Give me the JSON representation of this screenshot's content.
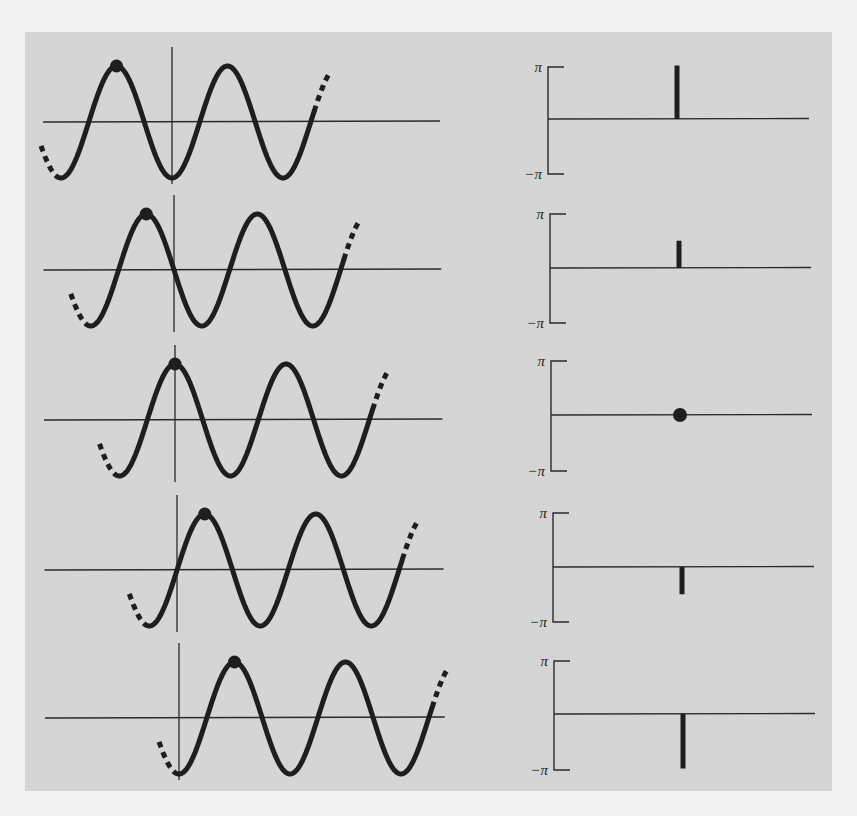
{
  "figure": {
    "background_color": "#f3f3f3",
    "panel_color": "#d5d5d5",
    "curve_color": "#1e1e1e",
    "axis_color": "#2a2a2a"
  },
  "chart_data": {
    "type": "diagram",
    "title": "",
    "phase_axis": {
      "top_label": "π",
      "bottom_label": "−π",
      "range": [
        -3.14159,
        3.14159
      ]
    },
    "rows": [
      {
        "index": 1,
        "wave": {
          "peak_offset_fraction_of_period": -0.5,
          "marker": "peak-dot"
        },
        "phase": {
          "value": 3.14159,
          "label": "π",
          "marker": "stick"
        },
        "layout": {
          "axis_y": 122,
          "vaxis_x": 172,
          "phase_axis_y": 119,
          "pi_top_y": 67,
          "pi_bottom_y": 174,
          "bracket_x": 548,
          "stick_x": 677,
          "axis_end_x": 809
        }
      },
      {
        "index": 2,
        "wave": {
          "peak_offset_fraction_of_period": -0.25,
          "marker": "peak-dot"
        },
        "phase": {
          "value": 1.5708,
          "label": "π/2",
          "marker": "stick"
        },
        "layout": {
          "axis_y": 270,
          "vaxis_x": 174,
          "phase_axis_y": 268,
          "pi_top_y": 214,
          "pi_bottom_y": 323,
          "bracket_x": 550,
          "stick_x": 679,
          "axis_end_x": 811
        }
      },
      {
        "index": 3,
        "wave": {
          "peak_offset_fraction_of_period": 0,
          "marker": "peak-dot"
        },
        "phase": {
          "value": 0,
          "label": "0",
          "marker": "dot"
        },
        "layout": {
          "axis_y": 420,
          "vaxis_x": 175,
          "phase_axis_y": 415,
          "pi_top_y": 361,
          "pi_bottom_y": 471,
          "bracket_x": 551,
          "stick_x": 680,
          "axis_end_x": 812
        }
      },
      {
        "index": 4,
        "wave": {
          "peak_offset_fraction_of_period": 0.25,
          "marker": "peak-dot"
        },
        "phase": {
          "value": -1.5708,
          "label": "−π/2",
          "marker": "stick"
        },
        "layout": {
          "axis_y": 570,
          "vaxis_x": 177,
          "phase_axis_y": 567,
          "pi_top_y": 513,
          "pi_bottom_y": 622,
          "bracket_x": 553,
          "stick_x": 682,
          "axis_end_x": 814
        }
      },
      {
        "index": 5,
        "wave": {
          "peak_offset_fraction_of_period": 0.5,
          "marker": "peak-dot"
        },
        "phase": {
          "value": -3.14159,
          "label": "−π",
          "marker": "stick"
        },
        "layout": {
          "axis_y": 718,
          "vaxis_x": 179,
          "phase_axis_y": 714,
          "pi_top_y": 661,
          "pi_bottom_y": 770,
          "bracket_x": 554,
          "stick_x": 683,
          "axis_end_x": 815
        }
      }
    ],
    "wave_geometry": {
      "period_px": 111,
      "amplitude_px": 56,
      "axis_start_x": 43,
      "axis_end_x": 440,
      "vaxis_half_height": 70
    }
  }
}
